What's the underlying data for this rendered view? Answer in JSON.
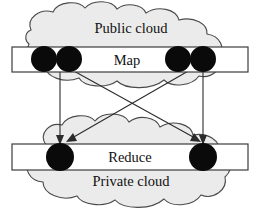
{
  "diagram": {
    "type": "flow-diagram",
    "canvas": {
      "width": 261,
      "height": 215
    },
    "clouds": [
      {
        "id": "public-cloud",
        "label": "Public cloud",
        "label_x": 131,
        "label_y": 33,
        "fill": "#ebebeb",
        "stroke": "#4a4a4a"
      },
      {
        "id": "private-cloud",
        "label": "Private cloud",
        "label_x": 131,
        "label_y": 186,
        "fill": "#ebebeb",
        "stroke": "#4a4a4a"
      }
    ],
    "bars": [
      {
        "id": "map-bar",
        "label": "Map",
        "x": 12,
        "y": 47,
        "width": 236,
        "height": 25,
        "label_x": 127,
        "label_y": 65,
        "fill": "#ffffff",
        "stroke": "#3c3c3c"
      },
      {
        "id": "reduce-bar",
        "label": "Reduce",
        "x": 12,
        "y": 144,
        "width": 236,
        "height": 26,
        "label_x": 130,
        "label_y": 162,
        "fill": "#ffffff",
        "stroke": "#3c3c3c"
      }
    ],
    "nodes": [
      {
        "id": "map-node-1",
        "bar": "map-bar",
        "cx": 44,
        "cy": 59,
        "r": 13,
        "color": "#0a0a0a"
      },
      {
        "id": "map-node-2",
        "bar": "map-bar",
        "cx": 69,
        "cy": 59,
        "r": 13,
        "color": "#0a0a0a"
      },
      {
        "id": "map-node-3",
        "bar": "map-bar",
        "cx": 178,
        "cy": 59,
        "r": 13,
        "color": "#0a0a0a"
      },
      {
        "id": "map-node-4",
        "bar": "map-bar",
        "cx": 203,
        "cy": 59,
        "r": 13,
        "color": "#0a0a0a"
      },
      {
        "id": "reduce-node-1",
        "bar": "reduce-bar",
        "cx": 60,
        "cy": 157,
        "r": 14,
        "color": "#0a0a0a"
      },
      {
        "id": "reduce-node-2",
        "bar": "reduce-bar",
        "cx": 203,
        "cy": 157,
        "r": 14,
        "color": "#0a0a0a"
      }
    ],
    "edges": [
      {
        "id": "edge-map1-reduce1",
        "from": "map-node-1",
        "to": "reduce-node-1",
        "x1": 60,
        "y1": 72,
        "x2": 60,
        "y2": 143,
        "kind": "vertical"
      },
      {
        "id": "edge-map2-reduce2",
        "from": "map-node-2",
        "to": "reduce-node-2",
        "x1": 72,
        "y1": 72,
        "x2": 199,
        "y2": 143,
        "kind": "diagonal"
      },
      {
        "id": "edge-map3-reduce1",
        "from": "map-node-3",
        "to": "reduce-node-1",
        "x1": 190,
        "y1": 72,
        "x2": 67,
        "y2": 143,
        "kind": "diagonal"
      },
      {
        "id": "edge-map4-reduce2",
        "from": "map-node-4",
        "to": "reduce-node-2",
        "x1": 203,
        "y1": 72,
        "x2": 203,
        "y2": 143,
        "kind": "vertical"
      }
    ],
    "colors": {
      "cloud_fill": "#ebebeb",
      "cloud_stroke": "#4a4a4a",
      "bar_fill": "#ffffff",
      "bar_stroke": "#3c3c3c",
      "node_fill": "#0a0a0a",
      "edge_stroke": "#2b2b2b",
      "text": "#111111",
      "background": "#ffffff"
    }
  }
}
